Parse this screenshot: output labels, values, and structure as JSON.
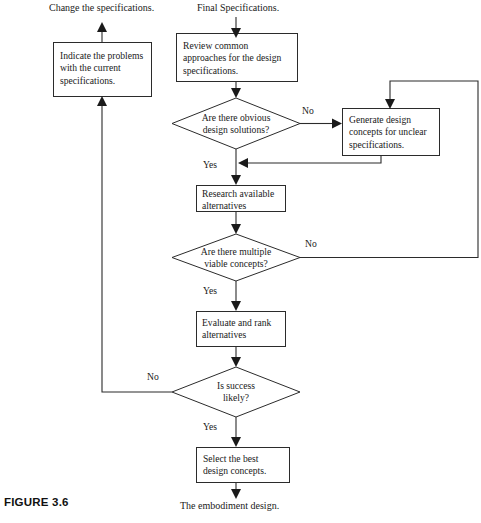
{
  "figure": {
    "caption": "FIGURE 3.6"
  },
  "terminals": {
    "input_label": "Final Specifications.",
    "feedback_output_label": "Change the specifications.",
    "output_label": "The embodiment design."
  },
  "nodes": {
    "indicate_problems": {
      "type": "process",
      "text": "Indicate the problems\nwith the current\nspecifications."
    },
    "review_approaches": {
      "type": "process",
      "text": "Review common\napproaches for the design\nspecifications."
    },
    "obvious_solutions": {
      "type": "decision",
      "text": "Are there obvious\ndesign solutions?"
    },
    "generate_concepts": {
      "type": "process",
      "text": "Generate design\nconcepts for unclear\nspecifications."
    },
    "research_alternatives": {
      "type": "process",
      "text": "Research available\nalternatives"
    },
    "multiple_concepts": {
      "type": "decision",
      "text": "Are there multiple\nviable concepts?"
    },
    "evaluate_rank": {
      "type": "process",
      "text": "Evaluate and rank\nalternatives"
    },
    "is_success_likely": {
      "type": "decision",
      "text": "Is success\nlikely?"
    },
    "select_best": {
      "type": "process",
      "text": "Select the best\ndesign concepts."
    }
  },
  "edge_labels": {
    "obvious_no": "No",
    "obvious_yes": "Yes",
    "multiple_no": "No",
    "multiple_yes": "Yes",
    "success_no": "No",
    "success_yes": "Yes"
  },
  "colors": {
    "stroke": "#2b2b2b",
    "fill": "#ffffff",
    "text": "#1a1a1a"
  }
}
